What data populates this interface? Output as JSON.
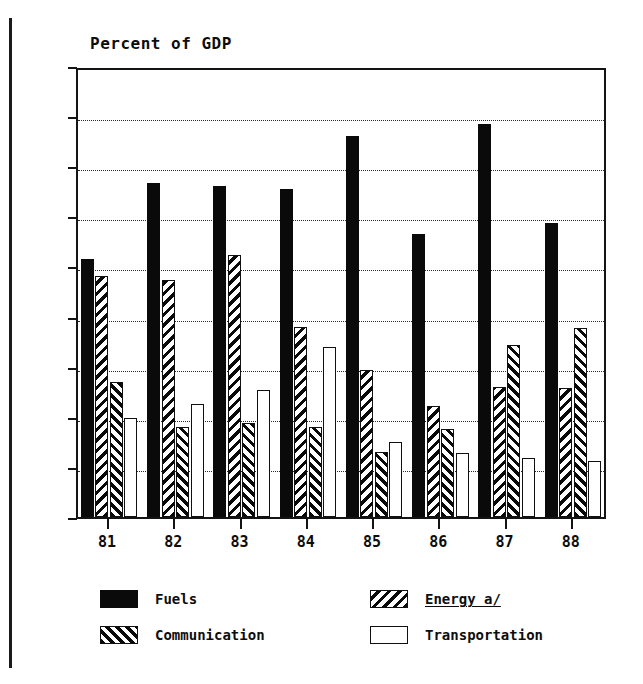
{
  "chart_data": {
    "type": "bar",
    "title": "Percent of GDP",
    "xlabel": "",
    "ylabel": "",
    "ylim": [
      0.0,
      1.8
    ],
    "ytick_step": 0.2,
    "grid": true,
    "grid_style": "dotted-horizontal",
    "legend_position": "below-plot",
    "categories": [
      "81",
      "82",
      "83",
      "84",
      "85",
      "86",
      "87",
      "88"
    ],
    "ytick_labels": [
      "0.0",
      "0.2",
      "0.4",
      "0.6",
      "0.8",
      "1.0",
      "1.2",
      "1.4",
      "1.6",
      "1.8"
    ],
    "series": [
      {
        "name": "Fuels",
        "key": "fuels",
        "pattern": "solid-black",
        "color": "#0a0a0a",
        "values": [
          1.03,
          1.335,
          1.32,
          1.31,
          1.52,
          1.13,
          1.57,
          1.175
        ]
      },
      {
        "name": "Energy a/",
        "key": "energy",
        "pattern": "backslash-hatch",
        "color": "#0a0a0a",
        "footnoted": true,
        "values": [
          0.96,
          0.945,
          1.045,
          0.76,
          0.585,
          0.445,
          0.52,
          0.515
        ]
      },
      {
        "name": "Communication",
        "key": "communication",
        "pattern": "forwardslash-hatch",
        "color": "#0a0a0a",
        "values": [
          0.54,
          0.36,
          0.375,
          0.36,
          0.26,
          0.35,
          0.685,
          0.755
        ]
      },
      {
        "name": "Transportation",
        "key": "transportation",
        "pattern": "open-white",
        "color": "#ffffff",
        "values": [
          0.395,
          0.45,
          0.505,
          0.68,
          0.3,
          0.255,
          0.235,
          0.225
        ]
      }
    ]
  },
  "legend": {
    "entries": [
      {
        "label": "Fuels",
        "key": "fuels",
        "footnoted": false
      },
      {
        "label": "Energy a/",
        "key": "energy",
        "footnoted": true
      },
      {
        "label": "Communication",
        "key": "communication",
        "footnoted": false
      },
      {
        "label": "Transportation",
        "key": "transportation",
        "footnoted": false
      }
    ]
  }
}
